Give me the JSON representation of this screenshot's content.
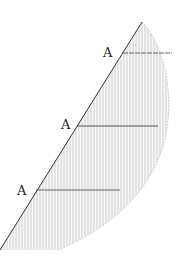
{
  "diagram": {
    "labels": [
      {
        "text": "A",
        "x": 103,
        "y": 46
      },
      {
        "text": "A",
        "x": 61,
        "y": 118
      },
      {
        "text": "A",
        "x": 17,
        "y": 184
      }
    ],
    "colors": {
      "ink": "#333333",
      "hatch": "#9a9a9a"
    }
  }
}
